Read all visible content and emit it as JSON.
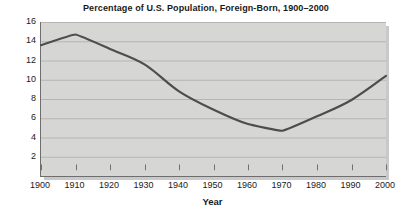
{
  "chart_data": {
    "type": "line",
    "title": "Percentage of U.S. Population, Foreign-Born, 1900–2000",
    "xlabel": "Year",
    "ylabel": "",
    "x": [
      1900,
      1910,
      1920,
      1930,
      1940,
      1950,
      1960,
      1970,
      1980,
      1990,
      2000
    ],
    "values": [
      13.6,
      14.7,
      13.2,
      11.6,
      8.8,
      6.9,
      5.4,
      4.7,
      6.2,
      7.9,
      10.4
    ],
    "categories": [
      "1900",
      "1910",
      "1920",
      "1930",
      "1940",
      "1950",
      "1960",
      "1970",
      "1980",
      "1990",
      "2000"
    ],
    "xtick_labels": [
      "1900",
      "1910",
      "1920",
      "1930",
      "1940",
      "1950",
      "1960",
      "1970",
      "1980",
      "1990",
      "2000"
    ],
    "ytick_labels": [
      "2",
      "4",
      "6",
      "8",
      "10",
      "12",
      "14",
      "16"
    ],
    "ytick_values": [
      2,
      4,
      6,
      8,
      10,
      12,
      14,
      16
    ],
    "xlim": [
      1900,
      2000
    ],
    "ylim": [
      0,
      16
    ],
    "grid": "horizontal",
    "legend": "none",
    "series_name": "Percentage foreign-born",
    "colors": {
      "line": "#4d4d4d",
      "plot_background": "#d6d6d4",
      "gridline": "#b5b5b3",
      "axis": "#6e6e6e",
      "text": "#1a1a1a",
      "page_background": "#ffffff",
      "shadow": "#c9c9c9"
    }
  }
}
